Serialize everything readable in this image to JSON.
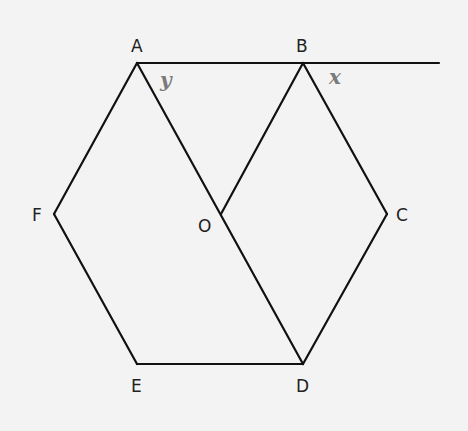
{
  "diagram": {
    "colors": {
      "background": "#f3f3f3",
      "line": "#111111",
      "vertex_label": "#222222",
      "angle_label": "#7a7a7a"
    },
    "vertices": {
      "A": {
        "label": "A",
        "x": 137,
        "y": 63
      },
      "B": {
        "label": "B",
        "x": 303,
        "y": 63
      },
      "C": {
        "label": "C",
        "x": 387,
        "y": 214
      },
      "D": {
        "label": "D",
        "x": 303,
        "y": 364
      },
      "E": {
        "label": "E",
        "x": 137,
        "y": 364
      },
      "F": {
        "label": "F",
        "x": 54,
        "y": 214
      },
      "O": {
        "label": "O",
        "x": 221,
        "y": 214
      }
    },
    "extension_end": {
      "x": 439,
      "y": 63
    },
    "segments": [
      [
        "A",
        "B"
      ],
      [
        "B",
        "C"
      ],
      [
        "C",
        "D"
      ],
      [
        "D",
        "E"
      ],
      [
        "E",
        "F"
      ],
      [
        "F",
        "A"
      ],
      [
        "A",
        "D"
      ],
      [
        "B",
        "O"
      ]
    ],
    "angles": {
      "y": {
        "label": "y",
        "at": "A",
        "description": "angle BAD"
      },
      "x": {
        "label": "x",
        "at": "B",
        "description": "exterior angle between BC and AB extended"
      }
    }
  }
}
